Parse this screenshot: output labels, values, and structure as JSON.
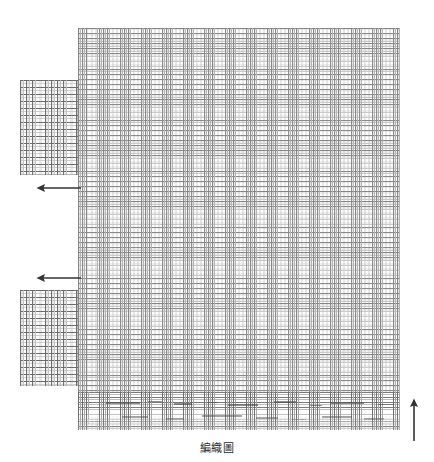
{
  "figure": {
    "caption": "編織圖",
    "background_color": "#ffffff",
    "line_color": "#6e6e6e",
    "arrow_color": "#333333"
  },
  "main_grid": {
    "name": "main-weave-grid",
    "x": 78,
    "y": 28,
    "width": 322,
    "height": 402,
    "cell_width_px": 4.2,
    "cell_height_px": 5.1,
    "columns": 77,
    "rows": 79,
    "description": "dense warp-and-weft weaving chart grid"
  },
  "bottom_band": {
    "name": "bottom-float-band",
    "x": 78,
    "y": 392,
    "width": 322,
    "height": 38,
    "description": "denser rows with dark float marks, fading at lower edge",
    "float_marks": [
      {
        "x": 28,
        "y": 10,
        "w": 34,
        "h": 1.6
      },
      {
        "x": 70,
        "y": 9,
        "w": 14,
        "h": 1.4
      },
      {
        "x": 96,
        "y": 11,
        "w": 18,
        "h": 1.5
      },
      {
        "x": 130,
        "y": 10,
        "w": 10,
        "h": 1.3
      },
      {
        "x": 150,
        "y": 12,
        "w": 30,
        "h": 1.6
      },
      {
        "x": 196,
        "y": 9,
        "w": 22,
        "h": 1.5
      },
      {
        "x": 232,
        "y": 13,
        "w": 12,
        "h": 1.3
      },
      {
        "x": 252,
        "y": 10,
        "w": 34,
        "h": 1.6
      },
      {
        "x": 300,
        "y": 12,
        "w": 16,
        "h": 1.4
      },
      {
        "x": 44,
        "y": 24,
        "w": 26,
        "h": 1.8
      },
      {
        "x": 88,
        "y": 26,
        "w": 18,
        "h": 1.6
      },
      {
        "x": 124,
        "y": 23,
        "w": 40,
        "h": 1.9
      },
      {
        "x": 178,
        "y": 25,
        "w": 22,
        "h": 1.6
      },
      {
        "x": 214,
        "y": 27,
        "w": 14,
        "h": 1.4
      },
      {
        "x": 244,
        "y": 24,
        "w": 30,
        "h": 1.8
      },
      {
        "x": 286,
        "y": 26,
        "w": 20,
        "h": 1.5
      }
    ]
  },
  "side_blocks": [
    {
      "name": "block-upper",
      "label": "upper-selvage-block",
      "x": 20,
      "y": 80,
      "width": 58,
      "height": 95,
      "cell_width_px": 6.2,
      "cell_height_px": 7.0,
      "columns": 9,
      "rows": 13
    },
    {
      "name": "block-lower",
      "label": "lower-selvage-block",
      "x": 20,
      "y": 290,
      "width": 58,
      "height": 96,
      "cell_width_px": 6.2,
      "cell_height_px": 7.0,
      "columns": 9,
      "rows": 13
    }
  ],
  "arrows": [
    {
      "name": "arrow-left-upper",
      "direction": "left",
      "x": 36,
      "y": 180,
      "length": 46,
      "meaning": "weft direction indicator (upper)"
    },
    {
      "name": "arrow-left-lower",
      "direction": "left",
      "x": 36,
      "y": 270,
      "length": 46,
      "meaning": "weft direction indicator (lower)"
    },
    {
      "name": "arrow-up-right",
      "direction": "up",
      "x": 406,
      "y": 398,
      "length": 44,
      "meaning": "warp direction indicator"
    }
  ]
}
